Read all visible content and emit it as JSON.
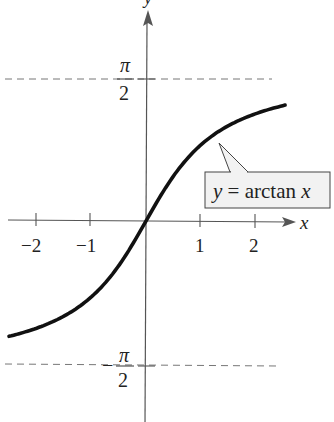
{
  "chart_data": {
    "type": "line",
    "title": "",
    "function": "y = arctan x",
    "xlabel": "x",
    "ylabel": "y",
    "x_ticks": [
      -2,
      -1,
      1,
      2
    ],
    "x_tick_labels": [
      "−2",
      "−1",
      "1",
      "2"
    ],
    "y_ticks": [
      1.5708,
      -1.5708
    ],
    "y_tick_labels": [
      {
        "num": "π",
        "den": "2",
        "sign": ""
      },
      {
        "num": "π",
        "den": "2",
        "sign": "−"
      }
    ],
    "xlim": [
      -2.6,
      2.9
    ],
    "ylim": [
      -2.2,
      1.55
    ],
    "asymptotes": [
      1.5708,
      -1.5708
    ],
    "series": [
      {
        "name": "y = arctan x",
        "x": [
          -2.49,
          -2.0,
          -1.5,
          -1.0,
          -0.5,
          0,
          0.5,
          1.0,
          1.5,
          2.0,
          2.53
        ],
        "y": [
          -1.189,
          -1.107,
          -0.983,
          -0.785,
          -0.464,
          0,
          0.464,
          0.785,
          0.983,
          1.107,
          1.195
        ]
      }
    ],
    "annotation": {
      "text_y": "y",
      "text_eq": " = arctan ",
      "text_x": "x"
    },
    "grid": false,
    "legend": "callout box"
  }
}
